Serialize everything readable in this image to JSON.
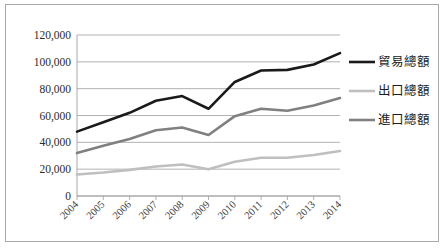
{
  "chart_data": {
    "type": "line",
    "title": "",
    "subtitle": "",
    "xlabel": "",
    "ylabel": "",
    "categories": [
      "2004",
      "2005",
      "2006",
      "2007",
      "2008",
      "2009",
      "2010",
      "2011",
      "2012",
      "2013",
      "2014"
    ],
    "ylim": [
      0,
      120000
    ],
    "ytick_values": [
      0,
      20000,
      40000,
      60000,
      80000,
      100000,
      120000
    ],
    "ytick_labels": [
      "0",
      "20,000",
      "40,000",
      "60,000",
      "80,000",
      "100,000",
      "120,000"
    ],
    "grid": true,
    "grid_axis": "y",
    "legend_position": "right",
    "xtick_rotation": 45,
    "series": [
      {
        "name": "貿易總額",
        "color": "#1a1a1a",
        "width": 2.6,
        "values": [
          48000,
          55000,
          62000,
          71000,
          74500,
          65000,
          85000,
          93500,
          94000,
          98000,
          106500
        ]
      },
      {
        "name": "出口總額",
        "color": "#bfbfbf",
        "width": 2.6,
        "values": [
          16000,
          17500,
          19500,
          22000,
          23500,
          20000,
          25500,
          28500,
          28500,
          30500,
          33500
        ]
      },
      {
        "name": "進口總額",
        "color": "#808080",
        "width": 2.6,
        "values": [
          32000,
          37500,
          42500,
          49000,
          51000,
          45500,
          59500,
          65000,
          63500,
          67500,
          73000
        ]
      }
    ]
  },
  "legend": {
    "items": [
      {
        "label": "貿易總額",
        "color": "#1a1a1a"
      },
      {
        "label": "出口總額",
        "color": "#bfbfbf"
      },
      {
        "label": "進口總額",
        "color": "#808080"
      }
    ]
  },
  "axes": {
    "y": {
      "labels": [
        "120,000",
        "100,000",
        "80,000",
        "60,000",
        "40,000",
        "20,000",
        "0"
      ]
    },
    "x": {
      "labels": [
        "2004",
        "2005",
        "2006",
        "2007",
        "2008",
        "2009",
        "2010",
        "2011",
        "2012",
        "2013",
        "2014"
      ]
    }
  },
  "colors": {
    "grid": "#9e9e9e",
    "frame": "#a8a8a8",
    "background": "#ffffff",
    "text": "#2b2b2b"
  }
}
